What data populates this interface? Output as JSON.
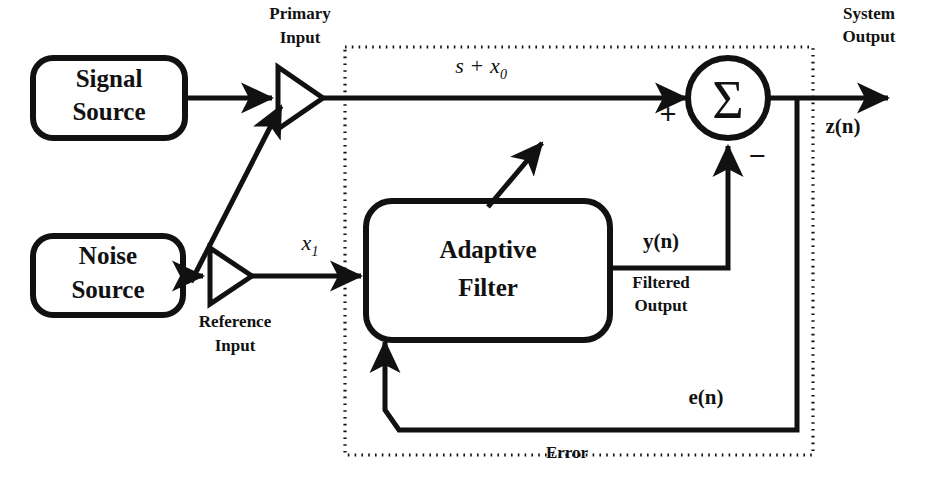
{
  "diagram": {
    "colors": {
      "stroke": "#111111",
      "background": "#ffffff"
    },
    "blocks": [
      {
        "id": "signal_source",
        "line1": "Signal",
        "line2": "Source"
      },
      {
        "id": "noise_source",
        "line1": "Noise",
        "line2": "Source"
      },
      {
        "id": "adaptive_filter",
        "line1": "Adaptive",
        "line2": "Filter"
      }
    ],
    "amplifiers": [
      {
        "id": "primary_input",
        "label_line1": "Primary",
        "label_line2": "Input"
      },
      {
        "id": "reference_input",
        "label_line1": "Reference",
        "label_line2": "Input"
      }
    ],
    "summing_junction": {
      "glyph": "Σ",
      "plus_sign": "+",
      "minus_sign": "−"
    },
    "signals": {
      "primary_signal_base": "s",
      "primary_signal_op": "+",
      "primary_signal_term": "x",
      "primary_signal_subscript": "0",
      "reference_signal_term": "x",
      "reference_signal_subscript": "1",
      "filter_output": "y(n)",
      "filter_output_caption_line1": "Filtered",
      "filter_output_caption_line2": "Output",
      "system_output": "z(n)",
      "system_output_caption_line1": "System",
      "system_output_caption_line2": "Output",
      "error_signal": "e(n)",
      "error_caption": "Error"
    }
  }
}
